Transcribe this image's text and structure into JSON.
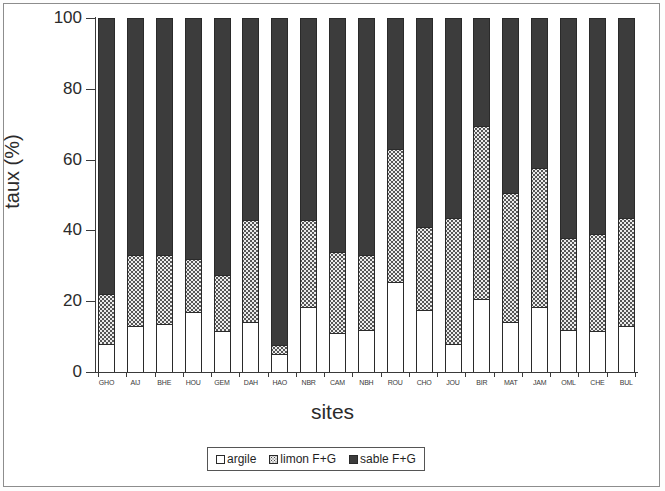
{
  "chart_data": {
    "type": "bar",
    "subtype": "stacked-percentage",
    "title": "",
    "xlabel": "sites",
    "ylabel": "taux (%)",
    "ylim": [
      0,
      100
    ],
    "yticks": [
      0,
      20,
      40,
      60,
      80,
      100
    ],
    "ytick_labels": [
      "0",
      "20",
      "40",
      "60",
      "80",
      "100"
    ],
    "grid": false,
    "legend_position": "bottom-center",
    "categories": [
      "GHO",
      "AIJ",
      "BHE",
      "HOU",
      "GEM",
      "DAH",
      "HAO",
      "NBR",
      "CAM",
      "NBH",
      "ROU",
      "CHO",
      "JOU",
      "BIR",
      "MAT",
      "JAM",
      "OML",
      "CHE",
      "BUL"
    ],
    "series": [
      {
        "name": "argile",
        "color": "#ffffff",
        "fill": "white",
        "values": [
          8,
          13,
          13.5,
          17,
          11.5,
          14,
          5,
          18.5,
          11,
          12,
          25.5,
          17.5,
          8,
          20.5,
          14,
          18.5,
          12,
          11.5,
          13
        ]
      },
      {
        "name": "limon F+G",
        "color": "#ececec",
        "fill": "dotted",
        "values": [
          14,
          20,
          19.5,
          15,
          16,
          29,
          2.5,
          24.5,
          23,
          21,
          37.5,
          23.5,
          35.5,
          49,
          36.5,
          39,
          26,
          27.5,
          30.5
        ]
      },
      {
        "name": "sable F+G",
        "color": "#3c3c3c",
        "fill": "solid",
        "values": [
          78,
          67,
          67,
          68,
          72.5,
          57,
          92.5,
          57,
          66,
          67,
          37,
          59,
          56.5,
          30.5,
          49.5,
          42.5,
          62,
          61,
          56.5
        ]
      }
    ],
    "cumulative_tops": {
      "argile": [
        8,
        13,
        13.5,
        17,
        11.5,
        14,
        5,
        18.5,
        11,
        12,
        25.5,
        17.5,
        8,
        20.5,
        14,
        18.5,
        12,
        11.5,
        13
      ],
      "limon": [
        22,
        33,
        33,
        32,
        27.5,
        43,
        7.5,
        43,
        34,
        33,
        63,
        41,
        43.5,
        69.5,
        50.5,
        57.5,
        38,
        39,
        43.5
      ],
      "sable": [
        100,
        100,
        100,
        100,
        100,
        100,
        100,
        100,
        100,
        100,
        100,
        100,
        100,
        100,
        100,
        100,
        100,
        100,
        100
      ]
    }
  },
  "legend": {
    "items": [
      {
        "label": "argile",
        "swatch": "white-square-icon"
      },
      {
        "label": "limon F+G",
        "swatch": "dotted-square-icon"
      },
      {
        "label": "sable F+G",
        "swatch": "filled-square-icon"
      }
    ]
  }
}
